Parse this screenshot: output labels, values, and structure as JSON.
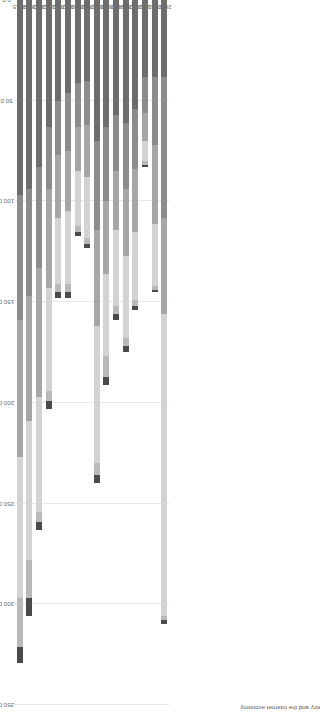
{
  "chart": {
    "axis_title": "Market capitalization of German companies in the ICT industry and the internet economy",
    "orientation": "horizontal-bars-rotated",
    "background": "#ffffff",
    "gridline_color": "#e8e8e8",
    "tick_color": "#6e6e6e"
  },
  "chart_data": {
    "type": "bar",
    "title": "",
    "subtitle": "",
    "xlabel": "",
    "ylabel": "Market capitalization of German companies in the ICT industry and the internet economy",
    "stacked": true,
    "grid": true,
    "legend": "none",
    "ylim": [
      0.0,
      350.0
    ],
    "ytick_labels": [
      "350.0",
      "300.0",
      "250.0",
      "200.0",
      "150.0",
      "100.0",
      "50.0",
      "0.0"
    ],
    "ytick_values": [
      350.0,
      300.0,
      250.0,
      200.0,
      150.0,
      100.0,
      50.0,
      0.0
    ],
    "categories": [
      "2015",
      "2014",
      "2013",
      "2012",
      "2011",
      "2010",
      "2009",
      "2008",
      "2007",
      "2006",
      "2005",
      "2004",
      "2003",
      "2002",
      "2001",
      "2000"
    ],
    "series": [
      {
        "name": "segment-1",
        "color": "#6d6d6d",
        "values": [
          97.0,
          94.0,
          83.0,
          63.0,
          50.0,
          46.0,
          41.0,
          40.0,
          70.0,
          63.0,
          57.0,
          61.0,
          54.0,
          38.0,
          38.0,
          38.0
        ]
      },
      {
        "name": "segment-2",
        "color": "#8c8c8c",
        "values": [
          62.0,
          53.0,
          50.0,
          31.0,
          27.0,
          29.0,
          22.0,
          22.0,
          44.0,
          37.0,
          28.0,
          33.0,
          30.0,
          18.0,
          34.0,
          70.0
        ]
      },
      {
        "name": "segment-3",
        "color": "#a6a6a6",
        "values": [
          68.0,
          62.0,
          64.0,
          49.0,
          31.0,
          30.0,
          22.0,
          26.0,
          48.0,
          36.0,
          29.0,
          33.0,
          31.0,
          14.0,
          39.0,
          48.0
        ]
      },
      {
        "name": "segment-4",
        "color": "#d3d3d3",
        "values": [
          70.0,
          69.0,
          57.0,
          51.0,
          33.0,
          36.0,
          27.0,
          30.0,
          68.0,
          41.0,
          38.0,
          41.0,
          34.0,
          10.0,
          31.0,
          150.0
        ]
      },
      {
        "name": "segment-5",
        "color": "#b9b9b9",
        "values": [
          24.0,
          19.0,
          5.0,
          5.0,
          4.0,
          4.0,
          3.0,
          3.0,
          6.0,
          10.0,
          4.0,
          4.0,
          3.0,
          2.0,
          2.0,
          2.0
        ]
      },
      {
        "name": "segment-6",
        "color": "#4a4a4a",
        "values": [
          8.0,
          9.0,
          4.0,
          4.0,
          3.0,
          3.0,
          2.0,
          2.0,
          4.0,
          4.0,
          3.0,
          3.0,
          2.0,
          1.0,
          1.0,
          2.0
        ]
      }
    ],
    "totals": [
      329.0,
      306.0,
      263.0,
      203.0,
      148.0,
      148.0,
      117.0,
      123.0,
      240.0,
      191.0,
      159.0,
      175.0,
      154.0,
      83.0,
      145.0,
      310.0
    ]
  }
}
